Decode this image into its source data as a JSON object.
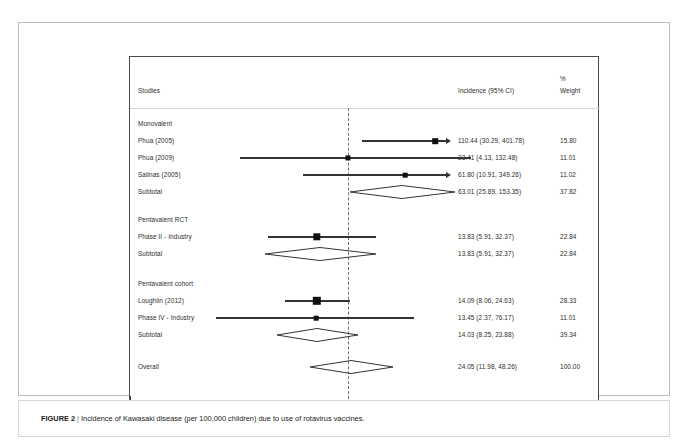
{
  "figure": {
    "label": "FIGURE 2",
    "separator": "|",
    "caption": "Incidence of Kawasaki disease (per 100,000 children) due to use of rotavirus vaccines."
  },
  "header": {
    "studies": "Studies",
    "incidence": "Incidence (95% CI)",
    "percent": "%",
    "weight": "Weight"
  },
  "axis": {
    "ticks": [
      {
        "label": "2.3",
        "x": 86
      },
      {
        "label": "150",
        "x": 324
      }
    ]
  },
  "chart_data": {
    "type": "forest",
    "title": "Incidence of Kawasaki disease (per 100,000 children) due to use of rotavirus vaccines.",
    "xlabel": "",
    "ylabel": "",
    "effect_measure": "Incidence (95% CI)",
    "weight_label": "% Weight",
    "x_scale": "log",
    "x_ticks": [
      2.3,
      150
    ],
    "reference_line": 24.05,
    "overall_estimate": 24.05,
    "groups": [
      {
        "name": "Monovalent",
        "rows": [
          {
            "study": "Phua (2005)",
            "estimate": 110.44,
            "ci_low": 30.29,
            "ci_high": 401.78,
            "ci_text": "110.44 (30.29, 401.78)",
            "weight": 15.8,
            "weight_text": "15.80",
            "type": "study",
            "truncated_right": true
          },
          {
            "study": "Phua (2009)",
            "estimate": 23.41,
            "ci_low": 4.13,
            "ci_high": 132.48,
            "ci_text": "23.41 (4.13, 132.48)",
            "weight": 11.01,
            "weight_text": "11.01",
            "type": "study",
            "truncated_right": false
          },
          {
            "study": "Salinas (2005)",
            "estimate": 61.8,
            "ci_low": 10.91,
            "ci_high": 349.26,
            "ci_text": "61.80 (10.91, 349.26)",
            "weight": 11.02,
            "weight_text": "11.02",
            "type": "study",
            "truncated_right": true
          },
          {
            "study": "Subtotal",
            "estimate": 63.01,
            "ci_low": 25.89,
            "ci_high": 153.35,
            "ci_text": "63.01 (25.89, 153.35)",
            "weight": 37.82,
            "weight_text": "37.82",
            "type": "subtotal"
          }
        ]
      },
      {
        "name": "Pentavalent RCT",
        "rows": [
          {
            "study": "Phase II - Industry",
            "estimate": 13.83,
            "ci_low": 5.91,
            "ci_high": 32.37,
            "ci_text": "13.83 (5.91, 32.37)",
            "weight": 22.84,
            "weight_text": "22.84",
            "type": "study",
            "truncated_right": false
          },
          {
            "study": "Subtotal",
            "estimate": 13.83,
            "ci_low": 5.91,
            "ci_high": 32.37,
            "ci_text": "13.83 (5.91, 32.37)",
            "weight": 22.84,
            "weight_text": "22.84",
            "type": "subtotal"
          }
        ]
      },
      {
        "name": "Pentavalent cohort",
        "rows": [
          {
            "study": "Loughlin (2012)",
            "estimate": 14.09,
            "ci_low": 8.06,
            "ci_high": 24.63,
            "ci_text": "14.09 (8.06, 24.63)",
            "weight": 28.33,
            "weight_text": "28.33",
            "type": "study",
            "truncated_right": false
          },
          {
            "study": "Phase IV - Industry",
            "estimate": 13.45,
            "ci_low": 2.37,
            "ci_high": 76.17,
            "ci_text": "13.45 (2.37, 76.17)",
            "weight": 11.01,
            "weight_text": "11.01",
            "type": "study",
            "truncated_right": false
          },
          {
            "study": "Subtotal",
            "estimate": 14.03,
            "ci_low": 8.25,
            "ci_high": 23.88,
            "ci_text": "14.03 (8.25, 23.88)",
            "weight": 39.34,
            "weight_text": "39.34",
            "type": "subtotal"
          }
        ]
      }
    ],
    "overall": {
      "study": "Overall",
      "estimate": 24.05,
      "ci_low": 11.98,
      "ci_high": 48.26,
      "ci_text": "24.05 (11.98, 48.26)",
      "weight": 100.0,
      "weight_text": "100.00",
      "type": "overall"
    }
  },
  "geometry": {
    "rows": [
      {
        "kind": "group",
        "label_key": "Monovalent",
        "top": 59
      },
      {
        "kind": "study",
        "top": 76,
        "line_x1": 232,
        "line_x2": 305,
        "marker_x": 305,
        "marker_w": 5.6,
        "arrow_x": 316,
        "arrow": true
      },
      {
        "kind": "study",
        "top": 93,
        "line_x1": 110,
        "line_x2": 341,
        "marker_x": 218,
        "marker_w": 5.2,
        "arrow": false
      },
      {
        "kind": "study",
        "top": 110,
        "line_x1": 173,
        "line_x2": 313,
        "marker_x": 275,
        "marker_w": 4.6,
        "arrow_x": 316,
        "arrow": true
      },
      {
        "kind": "subtotal",
        "top": 127,
        "d_x1": 220,
        "d_x2": 325,
        "d_cx": 272,
        "d_h": 13
      },
      {
        "kind": "gap",
        "top": 144
      },
      {
        "kind": "group",
        "label_key": "Pentavalent RCT",
        "top": 155
      },
      {
        "kind": "study",
        "top": 172,
        "line_x1": 138,
        "line_x2": 246,
        "marker_x": 187,
        "marker_w": 7.4,
        "arrow": false
      },
      {
        "kind": "subtotal",
        "top": 189,
        "d_x1": 135,
        "d_x2": 246,
        "d_cx": 190,
        "d_h": 13
      },
      {
        "kind": "gap",
        "top": 206
      },
      {
        "kind": "group",
        "label_key": "Pentavalent cohort",
        "top": 219
      },
      {
        "kind": "study",
        "top": 236,
        "line_x1": 155,
        "line_x2": 220,
        "marker_x": 187,
        "marker_w": 8.4,
        "arrow": false
      },
      {
        "kind": "study",
        "top": 253,
        "line_x1": 86,
        "line_x2": 284,
        "marker_x": 186,
        "marker_w": 4.6,
        "arrow": false
      },
      {
        "kind": "subtotal",
        "top": 270,
        "d_x1": 147,
        "d_x2": 228,
        "d_cx": 187,
        "d_h": 13
      },
      {
        "kind": "gap",
        "top": 287
      },
      {
        "kind": "overall",
        "top": 302,
        "d_x1": 180,
        "d_x2": 263,
        "d_cx": 221,
        "d_h": 13
      }
    ]
  }
}
